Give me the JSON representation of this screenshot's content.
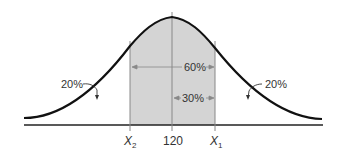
{
  "diagram": {
    "type": "normal-distribution",
    "mean_label": "120",
    "left_bound_label": "X",
    "left_bound_subscript": "2",
    "right_bound_label": "X",
    "right_bound_subscript": "1",
    "center_region_label": "60%",
    "half_region_label": "30%",
    "left_tail_label": "20%",
    "right_tail_label": "20%",
    "colors": {
      "curve": "#111111",
      "shade": "#d4d4d4",
      "lines": "#888888",
      "text": "#333333"
    }
  }
}
